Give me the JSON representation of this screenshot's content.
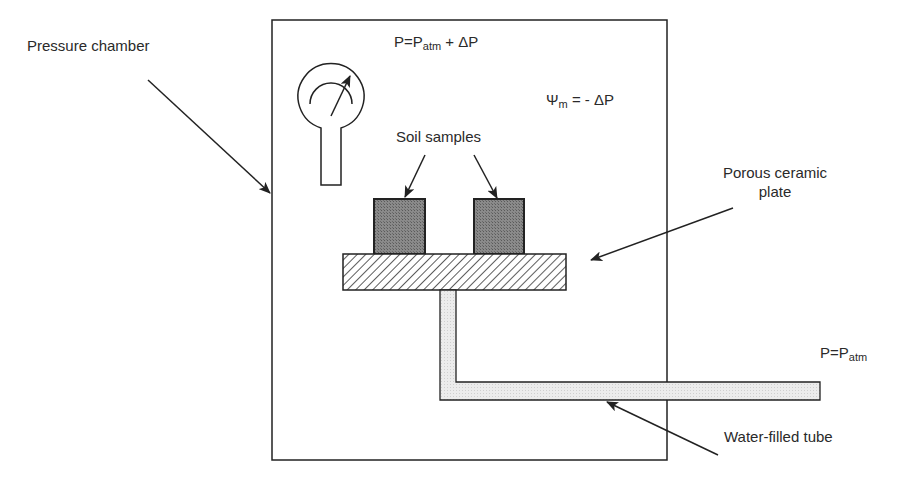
{
  "labels": {
    "pressure_chamber": "Pressure chamber",
    "chamber_pressure_lhs": "P=P",
    "chamber_pressure_sub": "atm",
    "chamber_pressure_rhs": " + ΔP",
    "matric_potential_lhs": "Ψ",
    "matric_potential_sub": "m",
    "matric_potential_rhs": " = - ΔP",
    "soil_samples": "Soil samples",
    "porous_plate_line1": "Porous ceramic",
    "porous_plate_line2": "plate",
    "outlet_pressure_lhs": "P=P",
    "outlet_pressure_sub": "atm",
    "water_tube": "Water-filled tube"
  },
  "colors": {
    "line": "#222222",
    "soil_fill": "#7a7a7a",
    "tube_fill": "#e6e6e6",
    "hatch": "#333333"
  }
}
